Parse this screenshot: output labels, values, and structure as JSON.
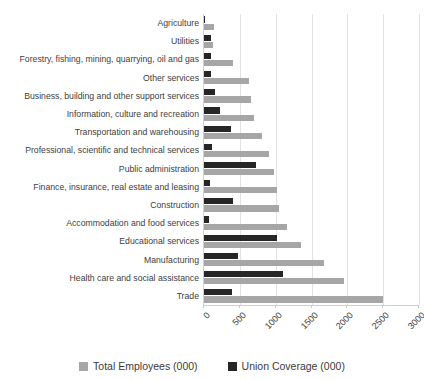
{
  "chart_data": {
    "type": "bar",
    "orientation": "horizontal",
    "title": "",
    "xlabel": "",
    "ylabel": "",
    "xlim": [
      0,
      3000
    ],
    "xticks": [
      0,
      500,
      1000,
      1500,
      2000,
      2500,
      3000
    ],
    "xtick_labels": [
      "0",
      "500",
      "1000",
      "1500",
      "2000",
      "2500",
      "3000"
    ],
    "grid": true,
    "legend_position": "bottom",
    "categories": [
      "Agriculture",
      "Utilities",
      "Forestry, fishing, mining, quarrying, oil and gas",
      "Other services",
      "Business, building and other support services",
      "Information, culture and recreation",
      "Transportation and warehousing",
      "Professional, scientific and technical services",
      "Public administration",
      "Finance, insurance, real estate and leasing",
      "Construction",
      "Accommodation and food services",
      "Educational services",
      "Manufacturing",
      "Health care and social assistance",
      "Trade"
    ],
    "series": [
      {
        "name": "Total Employees (000)",
        "color": "#a6a6a6",
        "values": [
          140,
          130,
          410,
          630,
          650,
          700,
          815,
          910,
          980,
          1020,
          1040,
          1160,
          1360,
          1680,
          1960,
          2500
        ]
      },
      {
        "name": "Union Coverage (000)",
        "color": "#262626",
        "values": [
          10,
          95,
          100,
          95,
          150,
          225,
          375,
          115,
          730,
          90,
          400,
          70,
          1020,
          480,
          1100,
          390
        ]
      }
    ]
  },
  "legend": {
    "items": [
      {
        "label": "Total Employees (000)",
        "color": "#a6a6a6"
      },
      {
        "label": "Union Coverage (000)",
        "color": "#262626"
      }
    ]
  }
}
